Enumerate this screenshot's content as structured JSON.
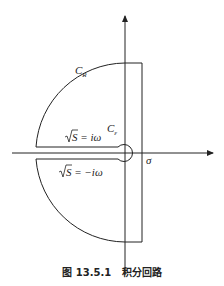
{
  "diagram": {
    "labels": {
      "outer_arc": "C",
      "outer_arc_sub": "R",
      "inner_circle": "C",
      "inner_circle_sub": "ε",
      "upper_branch_eq": "S = iω",
      "lower_branch_eq": "S = −iω",
      "horizontal_axis": "σ"
    },
    "caption": "图 13.5.1   积分回路",
    "colors": {
      "stroke": "#222222",
      "background": "#ffffff"
    }
  }
}
